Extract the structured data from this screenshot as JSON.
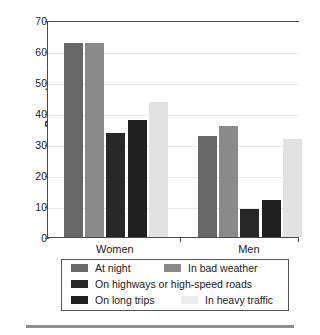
{
  "chart_data": {
    "type": "bar",
    "title": "",
    "subtitle": "",
    "xlabel": "",
    "ylabel": "Percentage",
    "ylim": [
      0,
      70
    ],
    "yticks": [
      0,
      10,
      20,
      30,
      40,
      50,
      60,
      70
    ],
    "ytick_labels": [
      "0",
      "10",
      "20",
      "30",
      "40",
      "50",
      "60",
      "70"
    ],
    "categories": [
      "Women",
      "Men"
    ],
    "grid": true,
    "legend_position": "below-plot",
    "series": [
      {
        "name": "At night",
        "color": "#676767",
        "values": [
          62.5,
          32.7
        ]
      },
      {
        "name": "In bad weather",
        "color": "#8a8a8a",
        "values": [
          62.5,
          35.7
        ]
      },
      {
        "name": "On highways or high-speed roads",
        "color": "#272727",
        "values": [
          33.6,
          9.0
        ]
      },
      {
        "name": "On long trips",
        "color": "#1f1f1f",
        "values": [
          37.6,
          12.0
        ]
      },
      {
        "name": "In heavy traffic",
        "color": "#e2e2e2",
        "values": [
          43.5,
          31.5
        ]
      }
    ]
  }
}
